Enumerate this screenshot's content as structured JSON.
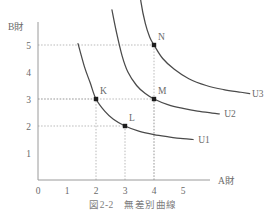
{
  "figure": {
    "caption": "図2-2　無差別曲線",
    "axis_titles": {
      "x": "A財",
      "y": "B財"
    }
  },
  "chart_data": {
    "type": "line",
    "title": "図2-2　無差別曲線",
    "xlabel": "A財",
    "ylabel": "B財",
    "xlim": [
      0,
      6
    ],
    "ylim": [
      0,
      6
    ],
    "xticks": [
      "0",
      "1",
      "2",
      "3",
      "4",
      "5"
    ],
    "yticks": [
      "0",
      "1",
      "2",
      "3",
      "4",
      "5"
    ],
    "grid": false,
    "legend": "inline-right",
    "series": [
      {
        "name": "U1",
        "label": "U1",
        "x": [
          1.38,
          1.6,
          1.8,
          2.0,
          2.3,
          2.6,
          3.0,
          3.5,
          4.0,
          4.5,
          5.0,
          5.35
        ],
        "y": [
          5.05,
          4.2,
          3.6,
          3.0,
          2.55,
          2.25,
          2.0,
          1.8,
          1.68,
          1.6,
          1.53,
          1.5
        ]
      },
      {
        "name": "U2",
        "label": "U2",
        "x": [
          2.55,
          2.7,
          2.9,
          3.1,
          3.4,
          3.7,
          4.0,
          4.5,
          5.0,
          5.5,
          6.0,
          6.25
        ],
        "y": [
          6.3,
          5.5,
          4.6,
          4.0,
          3.5,
          3.2,
          3.0,
          2.78,
          2.65,
          2.55,
          2.48,
          2.45
        ]
      },
      {
        "name": "U3",
        "label": "U3",
        "x": [
          3.45,
          3.55,
          3.7,
          3.85,
          4.0,
          4.3,
          4.7,
          5.2,
          5.8,
          6.4,
          7.0,
          7.3
        ],
        "y": [
          7.6,
          6.6,
          5.8,
          5.3,
          5.0,
          4.5,
          4.1,
          3.75,
          3.5,
          3.35,
          3.25,
          3.2
        ]
      }
    ],
    "points": [
      {
        "label": "K",
        "x": 2,
        "y": 3,
        "curve": "U1",
        "guides": [
          "x",
          "y"
        ]
      },
      {
        "label": "L",
        "x": 3,
        "y": 2,
        "curve": "U1",
        "guides": [
          "x",
          "y"
        ]
      },
      {
        "label": "M",
        "x": 4,
        "y": 3,
        "curve": "U2",
        "guides": [
          "x",
          "y"
        ]
      },
      {
        "label": "N",
        "x": 4,
        "y": 5,
        "curve": "U3",
        "guides": [
          "x",
          "y"
        ]
      }
    ],
    "colors": {
      "curve": "#4a4a4a",
      "axis": "#9a9a9a",
      "grid": "#b9b9b9",
      "text": "#6a6a6a",
      "marker": "#1d1d1d"
    }
  }
}
